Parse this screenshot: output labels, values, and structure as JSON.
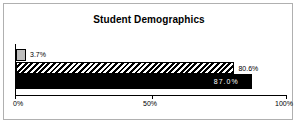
{
  "chart_data": {
    "type": "bar",
    "orientation": "horizontal",
    "title": "Student Demographics",
    "xlabel": "",
    "ylabel": "",
    "xlim": [
      0,
      100
    ],
    "grid": false,
    "legend": null,
    "tick_labels": [
      "0%",
      "50%",
      "100%"
    ],
    "ticks": [
      0,
      50,
      100
    ],
    "categories": [
      "series-1",
      "series-2",
      "series-3"
    ],
    "values": [
      3.7,
      80.6,
      87.0
    ],
    "data_labels": [
      "3.7%",
      "80.6%",
      "87.0%"
    ],
    "series": [
      {
        "name": "series-1",
        "value": 3.7,
        "label": "3.7%",
        "fill": "solid-gray",
        "color": "#bdbdbd",
        "label_position": "outside"
      },
      {
        "name": "series-2",
        "value": 80.6,
        "label": "80.6%",
        "fill": "diagonal-hatch",
        "color": "#000000",
        "label_position": "outside"
      },
      {
        "name": "series-3",
        "value": 87.0,
        "label": "87.0%",
        "fill": "solid-black",
        "color": "#000000",
        "label_position": "inside"
      }
    ]
  },
  "axis": {
    "tick_0": "0%",
    "tick_50": "50%",
    "tick_100": "100%"
  },
  "labels": {
    "bar_gray": "3.7%",
    "bar_hatched": "80.6%",
    "bar_black": "87.0%"
  },
  "title": "Student Demographics",
  "colors": {
    "frame": "#b0b0b0",
    "axis": "#000000",
    "gray_bar": "#bdbdbd",
    "black_bar": "#000000",
    "text": "#000000",
    "inverse_text": "#ffffff"
  }
}
